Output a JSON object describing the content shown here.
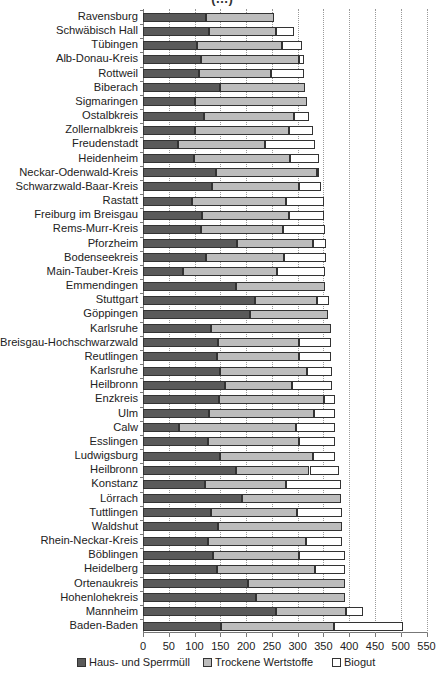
{
  "chart_data": {
    "type": "bar",
    "orientation": "horizontal",
    "stacked": true,
    "title": "(…)",
    "xlabel": "",
    "ylabel": "",
    "xlim": [
      0,
      550
    ],
    "xticks": [
      0,
      50,
      100,
      150,
      200,
      250,
      300,
      350,
      400,
      450,
      500,
      550
    ],
    "grid": "vertical dotted",
    "legend_position": "bottom",
    "categories": [
      "Ravensburg",
      "Schwäbisch Hall",
      "Tübingen",
      "Alb-Donau-Kreis",
      "Rottweil",
      "Biberach",
      "Sigmaringen",
      "Ostalbkreis",
      "Zollernalbkreis",
      "Freudenstadt",
      "Heidenheim",
      "Neckar-Odenwald-Kreis",
      "Schwarzwald-Baar-Kreis",
      "Rastatt",
      "Freiburg im Breisgau",
      "Rems-Murr-Kreis",
      "Pforzheim",
      "Bodenseekreis",
      "Main-Tauber-Kreis",
      "Emmendingen",
      "Stuttgart",
      "Göppingen",
      "Karlsruhe",
      "Breisgau-Hochschwarzwald",
      "Reutlingen",
      "Karlsruhe",
      "Heilbronn",
      "Enzkreis",
      "Ulm",
      "Calw",
      "Esslingen",
      "Ludwigsburg",
      "Heilbronn",
      "Konstanz",
      "Lörrach",
      "Tuttlingen",
      "Waldshut",
      "Rhein-Neckar-Kreis",
      "Böblingen",
      "Heidelberg",
      "Ortenaukreis",
      "Hohenlohekreis",
      "Mannheim",
      "Baden-Baden"
    ],
    "series": [
      {
        "name": "Haus- und Sperrmüll",
        "color": "#5a5a5a",
        "values": [
          123,
          128,
          104,
          112,
          109,
          149,
          101,
          118,
          101,
          67,
          99,
          141,
          133,
          96,
          114,
          112,
          182,
          122,
          77,
          181,
          217,
          208,
          132,
          145,
          143,
          149,
          159,
          148,
          128,
          70,
          127,
          150,
          180,
          121,
          193,
          131,
          146,
          126,
          135,
          144,
          204,
          220,
          258,
          151
        ]
      },
      {
        "name": "Trockene Wertstoffe",
        "color": "#bdbdbd",
        "values": [
          131,
          130,
          166,
          190,
          140,
          165,
          217,
          175,
          183,
          170,
          186,
          196,
          170,
          182,
          170,
          159,
          148,
          152,
          182,
          173,
          120,
          151,
          232,
          157,
          159,
          169,
          130,
          204,
          203,
          226,
          175,
          179,
          143,
          156,
          191,
          168,
          240,
          191,
          167,
          189,
          188,
          172,
          135,
          220
        ]
      },
      {
        "name": "Biogut",
        "color": "#ffffff",
        "values": [
          0,
          35,
          38,
          11,
          64,
          0,
          0,
          30,
          45,
          96,
          56,
          4,
          43,
          73,
          67,
          82,
          25,
          81,
          95,
          0,
          24,
          0,
          0,
          63,
          62,
          48,
          78,
          20,
          41,
          77,
          71,
          43,
          57,
          108,
          0,
          88,
          0,
          69,
          89,
          59,
          0,
          0,
          33,
          133
        ]
      }
    ],
    "totals": [
      254,
      293,
      308,
      313,
      313,
      314,
      318,
      323,
      329,
      333,
      341,
      341,
      346,
      351,
      351,
      353,
      355,
      355,
      354,
      354,
      361,
      359,
      364,
      365,
      364,
      366,
      367,
      372,
      372,
      373,
      373,
      372,
      380,
      385,
      384,
      387,
      386,
      386,
      391,
      392,
      392,
      392,
      426,
      504
    ]
  },
  "legend": {
    "items": [
      {
        "label": "Haus- und Sperrmüll",
        "color": "#5a5a5a"
      },
      {
        "label": "Trockene Wertstoffe",
        "color": "#bdbdbd"
      },
      {
        "label": "Biogut",
        "color": "#ffffff"
      }
    ]
  }
}
